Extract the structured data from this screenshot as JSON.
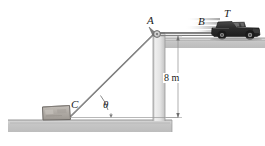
{
  "figure": {
    "type": "physics-mechanics-diagram",
    "labels": {
      "pulley": "A",
      "truck": "B",
      "tension": "T",
      "crate": "C",
      "angle": "θ"
    },
    "dimensions": {
      "height": "8 m"
    },
    "colors": {
      "ground_fill": "#c9c9c9",
      "ground_edge": "#8f8f8f",
      "wall_fill": "#e2e2e2",
      "wall_edge": "#9a9a9a",
      "cable": "#6b6b6b",
      "crate_fill": "#b5b0ab",
      "crate_edge": "#6e6a66",
      "truck_body": "#2b2b2b",
      "truck_window": "#5e5e5e",
      "dimension_line": "#8b8b8b",
      "label_text": "#1b1b1b",
      "motion_blur": "#c0c0c0"
    },
    "geometry": {
      "pulley_point": {
        "x": 157,
        "y": 31
      },
      "crate_point": {
        "x": 70,
        "y": 117
      },
      "upper_ground_y": 38,
      "lower_ground_y": 120,
      "wall_left_x": 153,
      "wall_right_x": 165,
      "dimension_x": 178,
      "dimension_top_y": 36,
      "dimension_bottom_y": 118
    }
  }
}
